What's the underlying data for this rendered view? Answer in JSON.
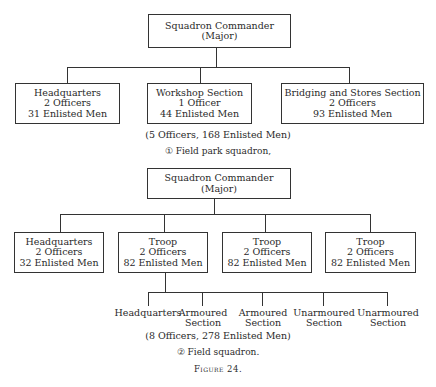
{
  "figure_label": "Figure 24.",
  "chart1": {
    "root": {
      "line1": "Squadron Commander",
      "line2": "(Major)"
    },
    "children": [
      {
        "name": "Headquarters",
        "officers": "2 Officers",
        "men": "31 Enlisted Men"
      },
      {
        "name": "Workshop Section",
        "officers": "1 Officer",
        "men": "44 Enlisted Men"
      },
      {
        "name": "Bridging and Stores Section",
        "officers": "2 Officers",
        "men": "93 Enlisted Men"
      }
    ],
    "total": "(5 Officers, 168 Enlisted Men)",
    "caption": "① Field park squadron,"
  },
  "chart2": {
    "root": {
      "line1": "Squadron Commander",
      "line2": "(Major)"
    },
    "children": [
      {
        "name": "Headquarters",
        "officers": "2 Officers",
        "men": "32 Enlisted Men"
      },
      {
        "name": "Troop",
        "officers": "2 Officers",
        "men": "82 Enlisted Men"
      },
      {
        "name": "Troop",
        "officers": "2 Officers",
        "men": "82 Enlisted Men"
      },
      {
        "name": "Troop",
        "officers": "2 Officers",
        "men": "82 Enlisted Men"
      }
    ],
    "troop_subunits": [
      {
        "line1": "Headquarters",
        "line2": ""
      },
      {
        "line1": "Armoured",
        "line2": "Section"
      },
      {
        "line1": "Armoured",
        "line2": "Section"
      },
      {
        "line1": "Unarmoured",
        "line2": "Section"
      },
      {
        "line1": "Unarmoured",
        "line2": "Section"
      }
    ],
    "total": "(8 Officers, 278 Enlisted Men)",
    "caption": "② Field squadron."
  }
}
